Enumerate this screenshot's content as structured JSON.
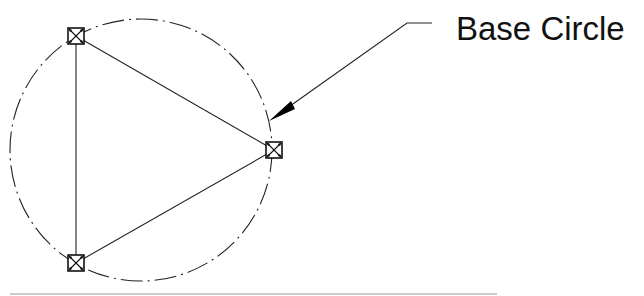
{
  "diagram": {
    "type": "engineering-sketch",
    "base_circle": {
      "center": [
        141,
        150
      ],
      "radius": 131,
      "line_style": "dash-dot",
      "stroke": "#222222"
    },
    "nodes": [
      {
        "id": "node-top",
        "x": 76,
        "y": 36
      },
      {
        "id": "node-right",
        "x": 274,
        "y": 150
      },
      {
        "id": "node-bottom",
        "x": 76,
        "y": 263
      }
    ],
    "node_size": 16,
    "triangle_edges": [
      [
        "node-top",
        "node-right"
      ],
      [
        "node-right",
        "node-bottom"
      ],
      [
        "node-bottom",
        "node-top"
      ]
    ],
    "leader": {
      "arrow_tip": [
        269,
        121
      ],
      "elbow": [
        407,
        23
      ],
      "end": [
        432,
        23
      ],
      "stroke": "#222222"
    },
    "label": {
      "text": "Base Circle",
      "x": 456,
      "y": 40
    },
    "baseline": {
      "x1": 10,
      "x2": 497,
      "y": 294,
      "stroke": "#bbbbbb"
    }
  }
}
